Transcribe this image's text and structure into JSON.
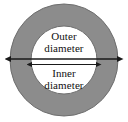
{
  "figure": {
    "background_color": "#ffffff"
  },
  "shapes": {
    "outer_ring": {
      "name": "outer-ring",
      "fill_color": "#8c8c8c",
      "stroke_color": "#6e6e6e",
      "center_x": 64,
      "center_y": 60,
      "radius_x": 54,
      "radius_y": 56
    },
    "inner_circle": {
      "name": "inner-circle",
      "fill_color": "#ffffff",
      "stroke_color": "#6e6e6e",
      "center_x": 64,
      "center_y": 60,
      "radius_x": 33,
      "radius_y": 34
    }
  },
  "annotations": {
    "outer_diameter": {
      "label_line_1": "Outer",
      "label_line_2": "diameter",
      "arrow_color": "#1a1a1a",
      "arrow_y": 59,
      "arrow_x_start": 10,
      "arrow_x_end": 118
    },
    "inner_diameter": {
      "label_line_1": "Inner",
      "label_line_2": "diameter",
      "arrow_color": "#1a1a1a",
      "arrow_y": 64,
      "arrow_x_start": 31,
      "arrow_x_end": 97
    }
  }
}
